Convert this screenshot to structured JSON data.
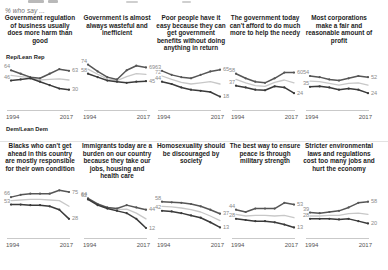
{
  "header": {
    "subhead": "% who say ...",
    "legend_rep": "Rep/Lean Rep",
    "legend_dem": "Dem/Lean Dem",
    "axis_start": "1994",
    "axis_end": "2017"
  },
  "colors": {
    "republican": "#565656",
    "democrat": "#3a3a3a",
    "light_line": "#c8c8c8",
    "value_label": "#9a9a9a",
    "axis": "#c9c9c9"
  },
  "chart_data": [
    {
      "id": "gov-regulation-harm",
      "type": "line",
      "title": "Government regulation of business usually does more harm than good",
      "xlabel": "",
      "ylabel": "",
      "ylim": [
        0,
        100
      ],
      "grid": false,
      "x": [
        "1994",
        "1999",
        "2004",
        "2009",
        "2011",
        "2014",
        "2017"
      ],
      "series": [
        {
          "name": "Rep/Lean Rep",
          "start_label": "64",
          "end_label": "63",
          "values": [
            64,
            58,
            52,
            50,
            58,
            66,
            63
          ]
        },
        {
          "name": "Dem/Lean Dem",
          "start_label": "46",
          "end_label": "30",
          "values": [
            46,
            48,
            50,
            44,
            38,
            32,
            30
          ]
        },
        {
          "name": "Total",
          "start_label": "",
          "end_label": "",
          "values": [
            55,
            53,
            51,
            47,
            48,
            49,
            47
          ]
        }
      ]
    },
    {
      "id": "gov-wasteful-inefficient",
      "type": "line",
      "title": "Government is almost always wasteful and inefficient",
      "xlabel": "",
      "ylabel": "",
      "ylim": [
        0,
        100
      ],
      "grid": false,
      "x": [
        "1994",
        "1999",
        "2004",
        "2009",
        "2011",
        "2014",
        "2017"
      ],
      "series": [
        {
          "name": "Rep/Lean Rep",
          "start_label": "74",
          "end_label": "69",
          "values": [
            74,
            62,
            52,
            48,
            64,
            72,
            69
          ]
        },
        {
          "name": "Dem/Lean Dem",
          "start_label": "58",
          "end_label": "45",
          "values": [
            58,
            52,
            46,
            44,
            42,
            44,
            45
          ]
        },
        {
          "name": "Total",
          "start_label": "",
          "end_label": "",
          "values": [
            66,
            57,
            49,
            46,
            53,
            58,
            57
          ]
        }
      ]
    },
    {
      "id": "poor-people-have-it-easy",
      "type": "line",
      "title": "Poor people have it easy because they can get government benefits without doing anything in return",
      "xlabel": "",
      "ylabel": "",
      "ylim": [
        0,
        100
      ],
      "grid": false,
      "x": [
        "1994",
        "1999",
        "2004",
        "2009",
        "2011",
        "2014",
        "2017"
      ],
      "series": [
        {
          "name": "Rep/Lean Rep",
          "start_label": "63",
          "end_label": "65",
          "values": [
            63,
            56,
            52,
            50,
            56,
            62,
            65
          ]
        },
        {
          "name": "Dem/Lean Dem",
          "start_label": "44",
          "end_label": "18",
          "values": [
            44,
            40,
            34,
            30,
            28,
            26,
            18
          ]
        },
        {
          "name": "Total",
          "start_label": "72",
          "end_label": "",
          "values": [
            54,
            48,
            43,
            40,
            42,
            44,
            40
          ]
        }
      ]
    },
    {
      "id": "government-cant-afford-needy",
      "type": "line",
      "title": "The government today can't afford to do much more to help the needy",
      "xlabel": "",
      "ylabel": "",
      "ylim": [
        0,
        100
      ],
      "grid": false,
      "x": [
        "1994",
        "1999",
        "2004",
        "2009",
        "2011",
        "2014",
        "2017"
      ],
      "series": [
        {
          "name": "Rep/Lean Rep",
          "start_label": "58",
          "end_label": "60",
          "values": [
            58,
            50,
            44,
            42,
            50,
            60,
            60
          ]
        },
        {
          "name": "Dem/Lean Dem",
          "start_label": "37",
          "end_label": "24",
          "values": [
            37,
            34,
            30,
            29,
            36,
            34,
            24
          ]
        },
        {
          "name": "Total",
          "start_label": "",
          "end_label": "",
          "values": [
            48,
            42,
            37,
            36,
            43,
            47,
            42
          ]
        }
      ]
    },
    {
      "id": "corporations-fair-profit",
      "type": "line",
      "title": "Most corporations make a fair and reasonable amount of profit",
      "xlabel": "",
      "ylabel": "",
      "ylim": [
        0,
        100
      ],
      "grid": false,
      "x": [
        "1994",
        "1999",
        "2004",
        "2009",
        "2011",
        "2014",
        "2017"
      ],
      "series": [
        {
          "name": "Rep/Lean Rep",
          "start_label": "54",
          "end_label": "52",
          "values": [
            54,
            52,
            48,
            46,
            50,
            54,
            52
          ]
        },
        {
          "name": "Dem/Lean Dem",
          "start_label": "35",
          "end_label": "24",
          "values": [
            35,
            36,
            34,
            30,
            32,
            30,
            24
          ]
        },
        {
          "name": "Total",
          "start_label": "",
          "end_label": "",
          "values": [
            45,
            44,
            41,
            38,
            41,
            42,
            38
          ]
        }
      ]
    },
    {
      "id": "blacks-own-condition",
      "type": "line",
      "title": "Blacks who can't get ahead in this country are mostly responsible for their own condition",
      "xlabel": "",
      "ylabel": "",
      "ylim": [
        0,
        100
      ],
      "grid": false,
      "x": [
        "1994",
        "1999",
        "2004",
        "2009",
        "2011",
        "2014",
        "2017"
      ],
      "series": [
        {
          "name": "Rep/Lean Rep",
          "start_label": "66",
          "end_label": "75",
          "values": [
            66,
            70,
            72,
            72,
            72,
            78,
            75
          ]
        },
        {
          "name": "Dem/Lean Dem",
          "start_label": "53",
          "end_label": "28",
          "values": [
            53,
            53,
            52,
            52,
            50,
            44,
            28
          ]
        },
        {
          "name": "Total",
          "start_label": "",
          "end_label": "",
          "values": [
            60,
            61,
            62,
            62,
            61,
            60,
            50
          ]
        }
      ]
    },
    {
      "id": "immigrants-burden",
      "type": "line",
      "title": "Immigrants today are a burden on our country because they take our jobs, housing and health care",
      "xlabel": "",
      "ylabel": "",
      "ylim": [
        0,
        100
      ],
      "grid": false,
      "x": [
        "1994",
        "1999",
        "2004",
        "2009",
        "2011",
        "2014",
        "2017"
      ],
      "series": [
        {
          "name": "Rep/Lean Rep",
          "start_label": "64",
          "end_label": "44",
          "values": [
            64,
            54,
            48,
            46,
            52,
            48,
            44
          ]
        },
        {
          "name": "Dem/Lean Dem",
          "start_label": "62",
          "end_label": "12",
          "values": [
            62,
            52,
            46,
            42,
            38,
            28,
            12
          ]
        },
        {
          "name": "Total",
          "start_label": "",
          "end_label": "",
          "values": [
            63,
            53,
            47,
            44,
            45,
            38,
            28
          ]
        }
      ]
    },
    {
      "id": "homosexuality-discouraged",
      "type": "line",
      "title": "Homosexuality should be discouraged by society",
      "xlabel": "",
      "ylabel": "",
      "ylim": [
        0,
        100
      ],
      "grid": false,
      "x": [
        "1994",
        "1999",
        "2004",
        "2009",
        "2011",
        "2014",
        "2017"
      ],
      "series": [
        {
          "name": "Rep/Lean Rep",
          "start_label": "58",
          "end_label": "37",
          "values": [
            58,
            57,
            56,
            54,
            50,
            44,
            37
          ]
        },
        {
          "name": "Dem/Lean Dem",
          "start_label": "42",
          "end_label": "13",
          "values": [
            42,
            41,
            38,
            34,
            30,
            22,
            13
          ]
        },
        {
          "name": "Total",
          "start_label": "",
          "end_label": "",
          "values": [
            50,
            49,
            47,
            44,
            40,
            33,
            25
          ]
        }
      ]
    },
    {
      "id": "peace-through-military-strength",
      "type": "line",
      "title": "The best way to ensure peace is through military strength",
      "xlabel": "",
      "ylabel": "",
      "ylim": [
        0,
        100
      ],
      "grid": false,
      "x": [
        "1994",
        "1999",
        "2004",
        "2009",
        "2011",
        "2014",
        "2017"
      ],
      "series": [
        {
          "name": "Rep/Lean Rep",
          "start_label": "44",
          "end_label": "53",
          "values": [
            44,
            40,
            46,
            46,
            46,
            56,
            53
          ]
        },
        {
          "name": "Dem/Lean Dem",
          "start_label": "28",
          "end_label": "13",
          "values": [
            28,
            26,
            24,
            24,
            22,
            18,
            13
          ]
        },
        {
          "name": "Total",
          "start_label": "",
          "end_label": "",
          "values": [
            36,
            33,
            34,
            34,
            33,
            34,
            30
          ]
        }
      ]
    },
    {
      "id": "environmental-laws-cost-jobs",
      "type": "line",
      "title": "Stricter environmental laws and regulations cost too many jobs and hurt the economy",
      "xlabel": "",
      "ylabel": "",
      "ylim": [
        0,
        100
      ],
      "grid": false,
      "x": [
        "1994",
        "1999",
        "2004",
        "2009",
        "2011",
        "2014",
        "2017"
      ],
      "series": [
        {
          "name": "Rep/Lean Rep",
          "start_label": "39",
          "end_label": "58",
          "values": [
            39,
            38,
            40,
            42,
            48,
            56,
            58
          ]
        },
        {
          "name": "Dem/Lean Dem",
          "start_label": "28",
          "end_label": "20",
          "values": [
            28,
            28,
            28,
            27,
            28,
            24,
            20
          ]
        },
        {
          "name": "Total",
          "start_label": "",
          "end_label": "",
          "values": [
            33,
            33,
            34,
            34,
            37,
            38,
            36
          ]
        }
      ]
    }
  ]
}
